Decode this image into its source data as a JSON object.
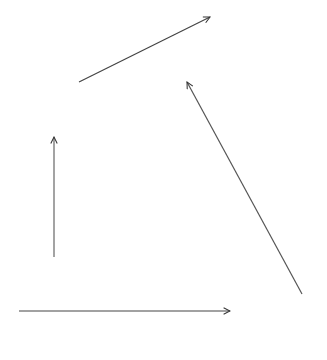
{
  "diagram": {
    "background_color": "#ffffff",
    "stroke_color": "#333333",
    "arrows": [
      {
        "id": "arrow-up-right",
        "direction": "up-right"
      },
      {
        "id": "arrow-up-left",
        "direction": "up-left"
      },
      {
        "id": "arrow-up",
        "direction": "up"
      },
      {
        "id": "arrow-right",
        "direction": "right"
      }
    ]
  }
}
